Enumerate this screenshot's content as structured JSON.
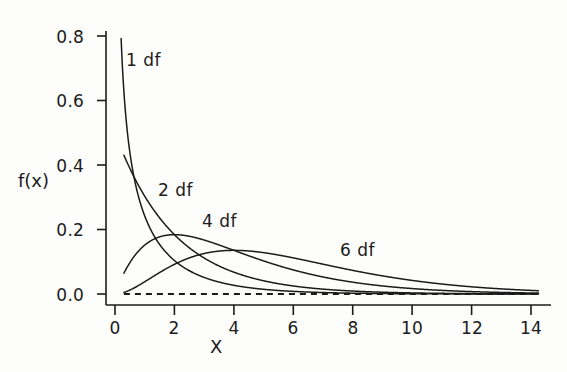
{
  "chart_data": {
    "type": "line",
    "title": "",
    "subtitle": "",
    "xlabel": "X",
    "ylabel": "f(x)",
    "xlim": [
      0,
      14.6
    ],
    "ylim": [
      0.0,
      0.86
    ],
    "grid": false,
    "legend_position": "inline-annotations",
    "x_ticks": [
      "0",
      "2",
      "4",
      "6",
      "8",
      "10",
      "12",
      "14"
    ],
    "x_tick_values": [
      0,
      2,
      4,
      6,
      8,
      10,
      12,
      14
    ],
    "y_ticks": [
      "0.0",
      "0.2",
      "0.4",
      "0.6",
      "0.8"
    ],
    "y_tick_values": [
      0.0,
      0.2,
      0.4,
      0.6,
      0.8
    ],
    "annotations": [
      {
        "text": "1 df",
        "x": 0.5,
        "y": 0.73
      },
      {
        "text": "2 df",
        "x": 1.7,
        "y": 0.36
      },
      {
        "text": "4 df",
        "x": 3.2,
        "y": 0.26
      },
      {
        "text": "6 df",
        "x": 7.9,
        "y": 0.17
      }
    ],
    "reference_line": {
      "y": 0.0,
      "style": "dashed",
      "x_from": 0.3,
      "x_to": 14.2
    },
    "x": [
      0.2,
      0.4,
      0.6,
      0.8,
      1.0,
      1.2,
      1.4,
      1.6,
      1.8,
      2.0,
      2.4,
      2.8,
      3.2,
      3.6,
      4.0,
      4.5,
      5.0,
      5.5,
      6.0,
      6.5,
      7.0,
      7.5,
      8.0,
      9.0,
      10.0,
      11.0,
      12.0,
      13.0,
      14.0
    ],
    "series": [
      {
        "name": "1 df",
        "label": "1 df",
        "df": 1,
        "color": "#1b1b1b",
        "values": [
          0.807,
          0.54,
          0.414,
          0.334,
          0.242,
          0.206,
          0.178,
          0.155,
          0.136,
          0.104,
          0.077,
          0.058,
          0.044,
          0.034,
          0.027,
          0.019,
          0.014,
          0.01,
          0.007,
          0.006,
          0.004,
          0.003,
          0.002,
          0.001,
          0.001,
          0.0,
          0.0,
          0.0,
          0.0
        ]
      },
      {
        "name": "2 df",
        "label": "2 df",
        "df": 2,
        "color": "#1b1b1b",
        "values": [
          0.452,
          0.409,
          0.37,
          0.335,
          0.303,
          0.274,
          0.248,
          0.225,
          0.203,
          0.184,
          0.151,
          0.123,
          0.101,
          0.083,
          0.068,
          0.053,
          0.041,
          0.032,
          0.025,
          0.019,
          0.015,
          0.012,
          0.009,
          0.006,
          0.003,
          0.002,
          0.001,
          0.001,
          0.0
        ]
      },
      {
        "name": "4 df",
        "label": "4 df",
        "df": 4,
        "color": "#1b1b1b",
        "values": [
          0.005,
          0.018,
          0.037,
          0.06,
          0.076,
          0.099,
          0.12,
          0.139,
          0.156,
          0.171,
          0.181,
          0.173,
          0.162,
          0.149,
          0.135,
          0.119,
          0.103,
          0.088,
          0.075,
          0.063,
          0.053,
          0.044,
          0.037,
          0.025,
          0.017,
          0.011,
          0.007,
          0.005,
          0.003
        ]
      },
      {
        "name": "6 df",
        "label": "6 df",
        "df": 6,
        "color": "#1b1b1b",
        "values": [
          0.0001,
          0.0007,
          0.002,
          0.005,
          0.01,
          0.016,
          0.024,
          0.033,
          0.044,
          0.054,
          0.075,
          0.095,
          0.112,
          0.124,
          0.134,
          0.14,
          0.141,
          0.137,
          0.129,
          0.12,
          0.109,
          0.098,
          0.087,
          0.066,
          0.049,
          0.035,
          0.024,
          0.017,
          0.011
        ]
      }
    ]
  },
  "axes": {
    "x_axis_title": "X",
    "y_axis_title": "f(x)"
  }
}
